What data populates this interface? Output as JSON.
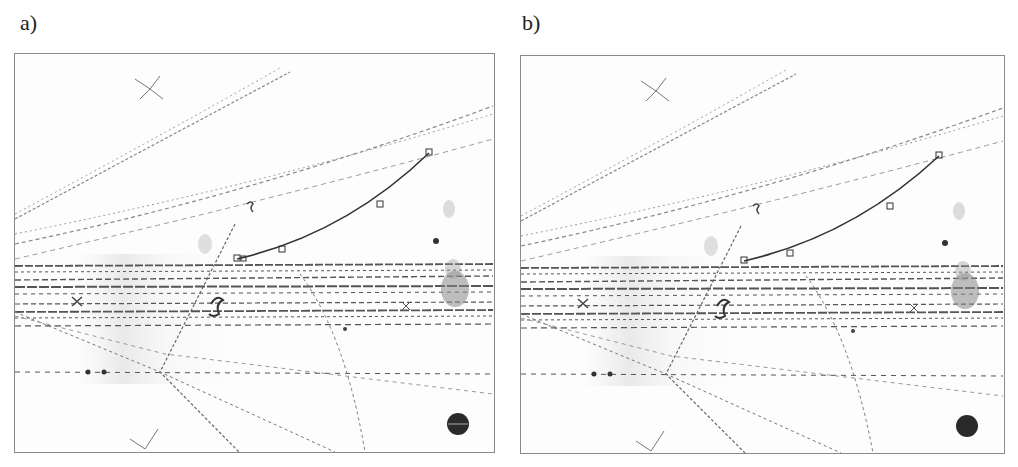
{
  "figure": {
    "panels": [
      {
        "id": "a",
        "label": "a)",
        "x": 14,
        "y": 53,
        "w": 479,
        "h": 398,
        "label_x": 20,
        "label_y": 10
      },
      {
        "id": "b",
        "label": "b)",
        "x": 520,
        "y": 55,
        "w": 483,
        "h": 397,
        "label_x": 522,
        "label_y": 10
      }
    ],
    "colors": {
      "track": "#555555",
      "fit_curve": "#3a3a3a",
      "frame": "#8a8a8a",
      "dark_spot": "#2a2a2a"
    },
    "fitted_track_points_a": [
      [
        236,
        258
      ],
      [
        281,
        248
      ],
      [
        380,
        203
      ],
      [
        428,
        152
      ]
    ],
    "fitted_track_points_b": [
      [
        743,
        260
      ],
      [
        789,
        252
      ],
      [
        889,
        204
      ],
      [
        938,
        155
      ]
    ]
  }
}
